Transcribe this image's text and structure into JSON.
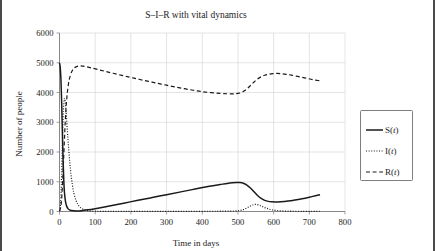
{
  "figure": {
    "title": "S–I–R with vital dynamics",
    "border_color": "#4a4a4a",
    "background": "#ffffff"
  },
  "chart_data": {
    "type": "line",
    "title": "S–I–R with vital dynamics",
    "xlabel": "Time in days",
    "ylabel": "Number of people",
    "xlim": [
      0,
      800
    ],
    "ylim": [
      0,
      6000
    ],
    "xticks": [
      0,
      100,
      200,
      300,
      400,
      500,
      600,
      700,
      800
    ],
    "yticks": [
      0,
      1000,
      2000,
      3000,
      4000,
      5000,
      6000
    ],
    "xtick_labels": [
      "0",
      "100",
      "200",
      "300",
      "400",
      "500",
      "600",
      "700",
      "800"
    ],
    "ytick_labels": [
      "0",
      "1000",
      "2000",
      "3000",
      "4000",
      "5000",
      "6000"
    ],
    "grid": true,
    "grid_color": "#c9c9c9",
    "legend_position": "right-outside",
    "line_color": "#1a1a1a",
    "series": [
      {
        "name": "S(t)",
        "style": "solid",
        "points": [
          [
            0,
            5000
          ],
          [
            2,
            4850
          ],
          [
            4,
            4450
          ],
          [
            6,
            3700
          ],
          [
            8,
            2700
          ],
          [
            10,
            1750
          ],
          [
            12,
            1050
          ],
          [
            14,
            620
          ],
          [
            17,
            320
          ],
          [
            20,
            180
          ],
          [
            25,
            80
          ],
          [
            30,
            42
          ],
          [
            40,
            22
          ],
          [
            50,
            20
          ],
          [
            60,
            28
          ],
          [
            80,
            55
          ],
          [
            100,
            95
          ],
          [
            140,
            185
          ],
          [
            180,
            280
          ],
          [
            220,
            375
          ],
          [
            260,
            470
          ],
          [
            300,
            565
          ],
          [
            340,
            660
          ],
          [
            380,
            755
          ],
          [
            420,
            845
          ],
          [
            450,
            905
          ],
          [
            470,
            945
          ],
          [
            485,
            968
          ],
          [
            495,
            975
          ],
          [
            505,
            972
          ],
          [
            515,
            950
          ],
          [
            525,
            890
          ],
          [
            535,
            790
          ],
          [
            545,
            665
          ],
          [
            555,
            540
          ],
          [
            565,
            440
          ],
          [
            575,
            375
          ],
          [
            585,
            340
          ],
          [
            595,
            325
          ],
          [
            605,
            320
          ],
          [
            620,
            328
          ],
          [
            640,
            352
          ],
          [
            660,
            388
          ],
          [
            680,
            432
          ],
          [
            700,
            482
          ],
          [
            720,
            535
          ],
          [
            730,
            562
          ]
        ]
      },
      {
        "name": "I(t)",
        "style": "dotted",
        "points": [
          [
            0,
            20
          ],
          [
            2,
            150
          ],
          [
            4,
            520
          ],
          [
            6,
            1240
          ],
          [
            8,
            2200
          ],
          [
            10,
            3080
          ],
          [
            12,
            3620
          ],
          [
            14,
            3800
          ],
          [
            16,
            3700
          ],
          [
            18,
            3430
          ],
          [
            20,
            3080
          ],
          [
            24,
            2380
          ],
          [
            28,
            1760
          ],
          [
            32,
            1270
          ],
          [
            36,
            900
          ],
          [
            40,
            630
          ],
          [
            46,
            380
          ],
          [
            52,
            225
          ],
          [
            60,
            118
          ],
          [
            70,
            58
          ],
          [
            80,
            30
          ],
          [
            95,
            14
          ],
          [
            110,
            8
          ],
          [
            140,
            5
          ],
          [
            180,
            4
          ],
          [
            240,
            4
          ],
          [
            300,
            5
          ],
          [
            360,
            6
          ],
          [
            420,
            8
          ],
          [
            460,
            11
          ],
          [
            490,
            18
          ],
          [
            505,
            32
          ],
          [
            515,
            62
          ],
          [
            525,
            118
          ],
          [
            535,
            185
          ],
          [
            543,
            228
          ],
          [
            550,
            238
          ],
          [
            558,
            218
          ],
          [
            566,
            178
          ],
          [
            575,
            132
          ],
          [
            585,
            90
          ],
          [
            595,
            58
          ],
          [
            610,
            32
          ],
          [
            630,
            16
          ],
          [
            650,
            10
          ],
          [
            680,
            7
          ],
          [
            710,
            7
          ],
          [
            730,
            8
          ]
        ]
      },
      {
        "name": "R(t)",
        "style": "dashed",
        "points": [
          [
            0,
            10
          ],
          [
            3,
            120
          ],
          [
            6,
            420
          ],
          [
            9,
            1050
          ],
          [
            12,
            1900
          ],
          [
            15,
            2750
          ],
          [
            18,
            3420
          ],
          [
            21,
            3880
          ],
          [
            25,
            4280
          ],
          [
            30,
            4560
          ],
          [
            36,
            4740
          ],
          [
            43,
            4840
          ],
          [
            50,
            4880
          ],
          [
            58,
            4895
          ],
          [
            66,
            4885
          ],
          [
            76,
            4862
          ],
          [
            90,
            4825
          ],
          [
            110,
            4765
          ],
          [
            130,
            4705
          ],
          [
            150,
            4648
          ],
          [
            175,
            4575
          ],
          [
            200,
            4505
          ],
          [
            225,
            4438
          ],
          [
            250,
            4372
          ],
          [
            275,
            4308
          ],
          [
            300,
            4245
          ],
          [
            325,
            4185
          ],
          [
            350,
            4128
          ],
          [
            375,
            4075
          ],
          [
            400,
            4028
          ],
          [
            425,
            3995
          ],
          [
            450,
            3970
          ],
          [
            470,
            3958
          ],
          [
            485,
            3955
          ],
          [
            495,
            3962
          ],
          [
            505,
            3985
          ],
          [
            515,
            4035
          ],
          [
            525,
            4120
          ],
          [
            535,
            4235
          ],
          [
            545,
            4355
          ],
          [
            555,
            4455
          ],
          [
            565,
            4528
          ],
          [
            575,
            4578
          ],
          [
            585,
            4610
          ],
          [
            598,
            4635
          ],
          [
            610,
            4642
          ],
          [
            622,
            4632
          ],
          [
            635,
            4612
          ],
          [
            650,
            4582
          ],
          [
            670,
            4535
          ],
          [
            690,
            4485
          ],
          [
            710,
            4432
          ],
          [
            730,
            4392
          ]
        ]
      }
    ]
  },
  "legend": {
    "items": [
      {
        "label": "S(t)",
        "label_main": "S(",
        "label_italic": "t",
        "label_tail": ")",
        "style": "solid"
      },
      {
        "label": "I(t)",
        "label_main": "I(",
        "label_italic": "t",
        "label_tail": ")",
        "style": "dotted"
      },
      {
        "label": "R(t)",
        "label_main": "R(",
        "label_italic": "t",
        "label_tail": ")",
        "style": "dashed"
      }
    ]
  }
}
